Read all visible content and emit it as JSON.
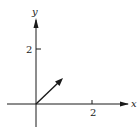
{
  "diagram": {
    "type": "vector-plot",
    "axes": {
      "x_label": "x",
      "y_label": "y",
      "x_tick": {
        "value": 2,
        "label": "2"
      },
      "y_tick": {
        "value": 2,
        "label": "2"
      }
    },
    "vector": {
      "from": [
        0,
        0
      ],
      "to": [
        1,
        1
      ]
    },
    "colors": {
      "ink": "#1a1a1a",
      "background": "#ffffff"
    }
  }
}
